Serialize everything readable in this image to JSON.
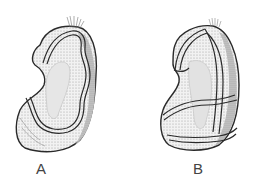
{
  "figure": {
    "panels": [
      {
        "id": "A",
        "label": "A",
        "description": "Stippled kidney-shaped cell with apical cilia tuft, lateral view"
      },
      {
        "id": "B",
        "label": "B",
        "description": "Stippled kidney-shaped cell with apical cilia tuft, alternate view"
      }
    ]
  },
  "colors": {
    "ink": "#2a2a2a",
    "stipple_dark": "#8a8a8a",
    "stipple_light": "#d4d4d4",
    "background": "#ffffff"
  }
}
